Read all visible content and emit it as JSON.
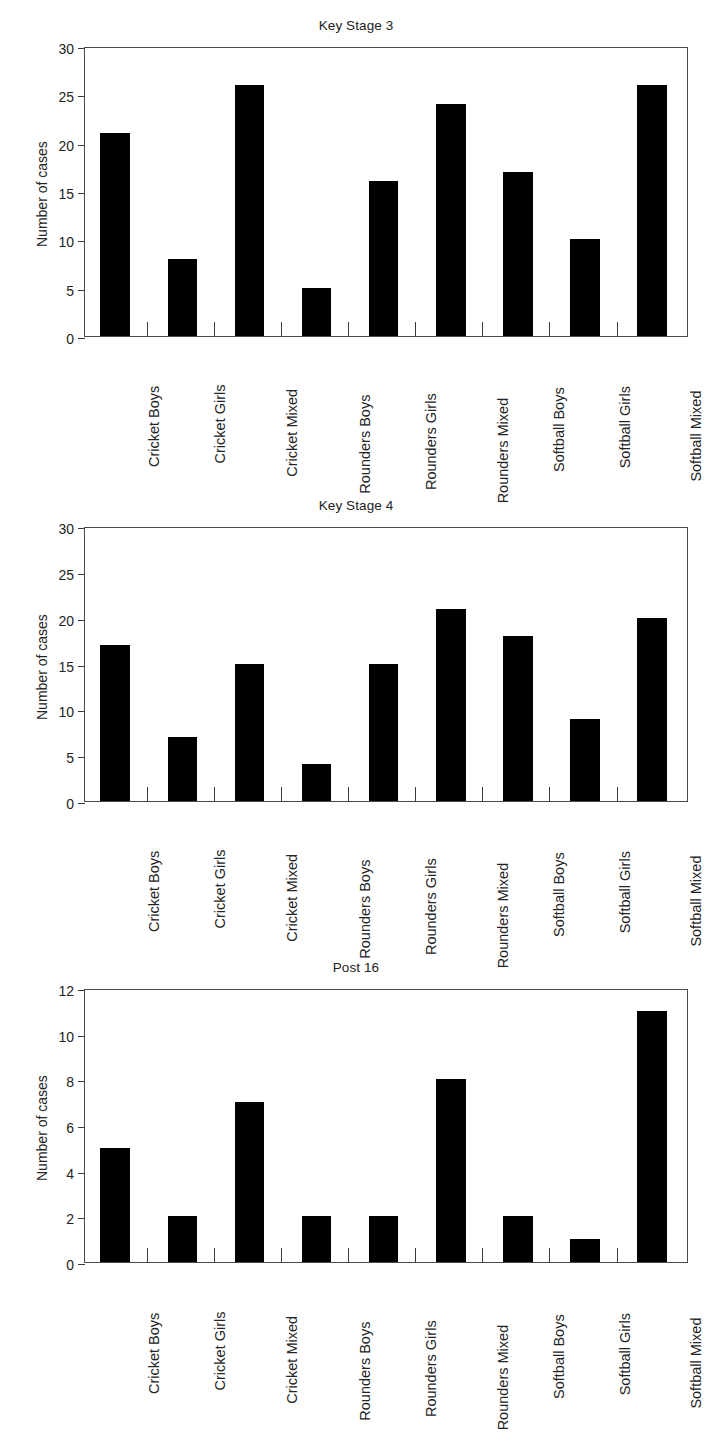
{
  "figure": {
    "categories": [
      "Cricket Boys",
      "Cricket Girls",
      "Cricket Mixed",
      "Rounders Boys",
      "Rounders Girls",
      "Rounders Mixed",
      "Softball Boys",
      "Softball Girls",
      "Softball Mixed"
    ],
    "ylabel": "Number of cases",
    "bar_color": "#000000",
    "axis_color": "#4a4a4a"
  },
  "chart_data": [
    {
      "type": "bar",
      "title": "Key Stage 3",
      "categories": [
        "Cricket Boys",
        "Cricket Girls",
        "Cricket Mixed",
        "Rounders Boys",
        "Rounders Girls",
        "Rounders Mixed",
        "Softball Boys",
        "Softball Girls",
        "Softball Mixed"
      ],
      "values": [
        21,
        8,
        26,
        5,
        16,
        24,
        17,
        10,
        26
      ],
      "xlabel": "",
      "ylabel": "Number of cases",
      "ylim": [
        0,
        30
      ],
      "yticks": [
        0,
        5,
        10,
        15,
        20,
        25,
        30
      ],
      "grid": false,
      "legend": false
    },
    {
      "type": "bar",
      "title": "Key Stage 4",
      "categories": [
        "Cricket Boys",
        "Cricket Girls",
        "Cricket Mixed",
        "Rounders Boys",
        "Rounders Girls",
        "Rounders Mixed",
        "Softball Boys",
        "Softball Girls",
        "Softball Mixed"
      ],
      "values": [
        17,
        7,
        15,
        4,
        15,
        21,
        18,
        9,
        20
      ],
      "xlabel": "",
      "ylabel": "Number of cases",
      "ylim": [
        0,
        30
      ],
      "yticks": [
        0,
        5,
        10,
        15,
        20,
        25,
        30
      ],
      "grid": false,
      "legend": false
    },
    {
      "type": "bar",
      "title": "Post 16",
      "categories": [
        "Cricket Boys",
        "Cricket Girls",
        "Cricket Mixed",
        "Rounders Boys",
        "Rounders Girls",
        "Rounders Mixed",
        "Softball Boys",
        "Softball Girls",
        "Softball Mixed"
      ],
      "values": [
        5,
        2,
        7,
        2,
        2,
        8,
        2,
        1,
        11
      ],
      "xlabel": "",
      "ylabel": "Number of cases",
      "ylim": [
        0,
        12
      ],
      "yticks": [
        0,
        2,
        4,
        6,
        8,
        10,
        12
      ],
      "grid": false,
      "legend": false
    }
  ]
}
